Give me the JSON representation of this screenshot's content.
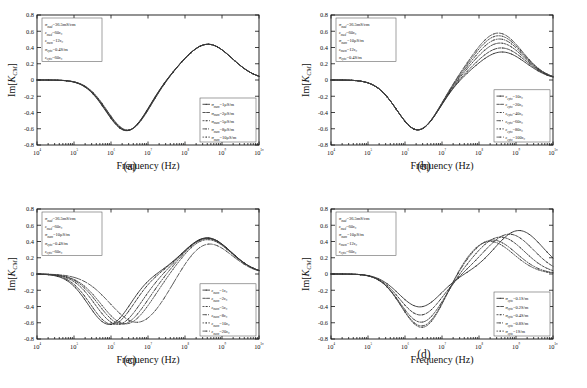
{
  "page_header": "",
  "figure": {
    "panels": [
      {
        "id": "a",
        "caption": "(a)",
        "ylabel": "Im[K_CM]",
        "xlabel": "Frequency (Hz)",
        "param_box": [
          {
            "sym": "σ",
            "sub": "med",
            "val": "=36.5mS/cm"
          },
          {
            "sym": "ε",
            "sub": "med",
            "val": "=60ε₀"
          },
          {
            "sym": "ε",
            "sub": "mem",
            "val": "=12ε₀"
          },
          {
            "sym": "σ",
            "sub": "cyto",
            "val": "=0.4S/m"
          },
          {
            "sym": "ε",
            "sub": "cyto",
            "val": "=60ε₀"
          }
        ],
        "legend_pos": "lower-right",
        "legend": [
          {
            "sym": "σ",
            "sub": "mem",
            "val": "=1μS/m"
          },
          {
            "sym": "σ",
            "sub": "mem",
            "val": "=2μS/m"
          },
          {
            "sym": "σ",
            "sub": "mem",
            "val": "=5μS/m"
          },
          {
            "sym": "σ",
            "sub": "mem",
            "val": "=8μS/m"
          },
          {
            "sym": "σ",
            "sub": "mem",
            "val": "=10μS/m"
          }
        ]
      },
      {
        "id": "b",
        "caption": "(b)",
        "ylabel": "Im[K_CM]",
        "xlabel": "Frequency (Hz)",
        "param_box": [
          {
            "sym": "σ",
            "sub": "med",
            "val": "=36.5mS/cm"
          },
          {
            "sym": "ε",
            "sub": "med",
            "val": "=60ε₀"
          },
          {
            "sym": "σ",
            "sub": "mem",
            "val": "=10μS/m"
          },
          {
            "sym": "ε",
            "sub": "mem",
            "val": "=12ε₀"
          },
          {
            "sym": "σ",
            "sub": "cyto",
            "val": "=0.4S/m"
          }
        ],
        "legend_pos": "lower-right",
        "legend": [
          {
            "sym": "ε",
            "sub": "cyto",
            "val": "=10ε₀"
          },
          {
            "sym": "ε",
            "sub": "cyto",
            "val": "=20ε₀"
          },
          {
            "sym": "ε",
            "sub": "cyto",
            "val": "=40ε₀"
          },
          {
            "sym": "ε",
            "sub": "cyto",
            "val": "=60ε₀"
          },
          {
            "sym": "ε",
            "sub": "cyto",
            "val": "=80ε₀"
          },
          {
            "sym": "ε",
            "sub": "cyto",
            "val": "=100ε₀"
          }
        ]
      },
      {
        "id": "c",
        "caption": "(c)",
        "ylabel": "Im[K_CM]",
        "xlabel": "Frequency (Hz)",
        "param_box": [
          {
            "sym": "σ",
            "sub": "med",
            "val": "=36.5mS/cm"
          },
          {
            "sym": "ε",
            "sub": "med",
            "val": "=60ε₀"
          },
          {
            "sym": "σ",
            "sub": "mem",
            "val": "=10μS/m"
          },
          {
            "sym": "σ",
            "sub": "cyto",
            "val": "=0.4S/m"
          },
          {
            "sym": "ε",
            "sub": "cyto",
            "val": "=60ε₀"
          }
        ],
        "legend_pos": "lower-right",
        "legend": [
          {
            "sym": "ε",
            "sub": "mem",
            "val": "=1ε₀"
          },
          {
            "sym": "ε",
            "sub": "mem",
            "val": "=2ε₀"
          },
          {
            "sym": "ε",
            "sub": "mem",
            "val": "=5ε₀"
          },
          {
            "sym": "ε",
            "sub": "mem",
            "val": "=8ε₀"
          },
          {
            "sym": "ε",
            "sub": "mem",
            "val": "=10ε₀"
          },
          {
            "sym": "ε",
            "sub": "mem",
            "val": "=20ε₀"
          }
        ]
      },
      {
        "id": "d",
        "caption": "(d)",
        "ylabel": "Im[K_CM]",
        "xlabel": "Frequency (Hz)",
        "param_box": [
          {
            "sym": "σ",
            "sub": "med",
            "val": "=36.5mS/cm"
          },
          {
            "sym": "ε",
            "sub": "med",
            "val": "=60ε₀"
          },
          {
            "sym": "σ",
            "sub": "mem",
            "val": "=10μS/m"
          },
          {
            "sym": "ε",
            "sub": "mem",
            "val": "=12ε₀"
          },
          {
            "sym": "ε",
            "sub": "cyto",
            "val": "=60ε₀"
          }
        ],
        "legend_pos": "lower-right",
        "legend": [
          {
            "sym": "σ",
            "sub": "cyto",
            "val": "=0.1S/m"
          },
          {
            "sym": "σ",
            "sub": "cyto",
            "val": "=0.2S/m"
          },
          {
            "sym": "σ",
            "sub": "cyto",
            "val": "=0.4S/m"
          },
          {
            "sym": "σ",
            "sub": "cyto",
            "val": "=0.8S/m"
          },
          {
            "sym": "σ",
            "sub": "cyto",
            "val": "=1S/m"
          }
        ]
      }
    ]
  },
  "chart_data": [
    {
      "type": "line",
      "panel": "a",
      "title": "",
      "xlabel": "Frequency (Hz)",
      "ylabel": "Im[K_CM]",
      "xscale": "log",
      "xlim": [
        10000,
        10000000000
      ],
      "ylim": [
        -0.8,
        0.8
      ],
      "xticks": [
        4,
        5,
        6,
        7,
        8,
        9,
        10
      ],
      "xticklabels": [
        "10⁴",
        "10⁵",
        "10⁶",
        "10⁷",
        "10⁸",
        "10⁹",
        "10¹⁰"
      ],
      "yticks": [
        -0.8,
        -0.6,
        -0.4,
        -0.2,
        0,
        0.2,
        0.4,
        0.6,
        0.8
      ],
      "grid": false,
      "legend_position": "lower right",
      "series": [
        {
          "name": "σmem=1μS/m",
          "dip_decade": 6.42,
          "dip_value": -0.625,
          "peak_decade": 8.62,
          "peak_value": 0.44
        },
        {
          "name": "σmem=2μS/m",
          "dip_decade": 6.43,
          "dip_value": -0.624,
          "peak_decade": 8.62,
          "peak_value": 0.44
        },
        {
          "name": "σmem=5μS/m",
          "dip_decade": 6.44,
          "dip_value": -0.622,
          "peak_decade": 8.62,
          "peak_value": 0.44
        },
        {
          "name": "σmem=8μS/m",
          "dip_decade": 6.45,
          "dip_value": -0.62,
          "peak_decade": 8.62,
          "peak_value": 0.44
        },
        {
          "name": "σmem=10μS/m",
          "dip_decade": 6.46,
          "dip_value": -0.618,
          "peak_decade": 8.62,
          "peak_value": 0.44
        }
      ]
    },
    {
      "type": "line",
      "panel": "b",
      "title": "",
      "xlabel": "Frequency (Hz)",
      "ylabel": "Im[K_CM]",
      "xscale": "log",
      "xlim": [
        10000,
        10000000000
      ],
      "ylim": [
        -0.8,
        0.8
      ],
      "xticks": [
        4,
        5,
        6,
        7,
        8,
        9,
        10
      ],
      "xticklabels": [
        "10⁴",
        "10⁵",
        "10⁶",
        "10⁷",
        "10⁸",
        "10⁹",
        "10¹⁰"
      ],
      "yticks": [
        -0.8,
        -0.6,
        -0.4,
        -0.2,
        0,
        0.2,
        0.4,
        0.6,
        0.8
      ],
      "grid": false,
      "legend_position": "lower right",
      "series": [
        {
          "name": "εcyto=10ε₀",
          "dip_decade": 6.35,
          "dip_value": -0.615,
          "peak_decade": 8.62,
          "peak_value": 0.345
        },
        {
          "name": "εcyto=20ε₀",
          "dip_decade": 6.35,
          "dip_value": -0.615,
          "peak_decade": 8.6,
          "peak_value": 0.395
        },
        {
          "name": "εcyto=40ε₀",
          "dip_decade": 6.35,
          "dip_value": -0.615,
          "peak_decade": 8.57,
          "peak_value": 0.455
        },
        {
          "name": "εcyto=60ε₀",
          "dip_decade": 6.35,
          "dip_value": -0.615,
          "peak_decade": 8.55,
          "peak_value": 0.505
        },
        {
          "name": "εcyto=80ε₀",
          "dip_decade": 6.35,
          "dip_value": -0.615,
          "peak_decade": 8.53,
          "peak_value": 0.545
        },
        {
          "name": "εcyto=100ε₀",
          "dip_decade": 6.35,
          "dip_value": -0.615,
          "peak_decade": 8.52,
          "peak_value": 0.578
        }
      ]
    },
    {
      "type": "line",
      "panel": "c",
      "title": "",
      "xlabel": "Frequency (Hz)",
      "ylabel": "Im[K_CM]",
      "xscale": "log",
      "xlim": [
        10000,
        10000000000
      ],
      "ylim": [
        -0.8,
        0.8
      ],
      "xticks": [
        4,
        5,
        6,
        7,
        8,
        9,
        10
      ],
      "xticklabels": [
        "10⁴",
        "10⁵",
        "10⁶",
        "10⁷",
        "10⁸",
        "10⁹",
        "10¹⁰"
      ],
      "yticks": [
        -0.8,
        -0.6,
        -0.4,
        -0.2,
        0,
        0.2,
        0.4,
        0.6,
        0.8
      ],
      "grid": false,
      "legend_position": "lower right",
      "series": [
        {
          "name": "εmem=1ε₀",
          "dip_decade": 5.95,
          "dip_value": -0.62,
          "peak_decade": 8.6,
          "peak_value": 0.445,
          "dip_width": 0.8
        },
        {
          "name": "εmem=2ε₀",
          "dip_decade": 6.03,
          "dip_value": -0.62,
          "peak_decade": 8.6,
          "peak_value": 0.443,
          "dip_width": 0.82
        },
        {
          "name": "εmem=5ε₀",
          "dip_decade": 6.18,
          "dip_value": -0.62,
          "peak_decade": 8.6,
          "peak_value": 0.44,
          "dip_width": 0.86
        },
        {
          "name": "εmem=8ε₀",
          "dip_decade": 6.3,
          "dip_value": -0.618,
          "peak_decade": 8.6,
          "peak_value": 0.435,
          "dip_width": 0.9
        },
        {
          "name": "εmem=10ε₀",
          "dip_decade": 6.4,
          "dip_value": -0.615,
          "peak_decade": 8.6,
          "peak_value": 0.425,
          "dip_width": 0.94
        },
        {
          "name": "εmem=20ε₀",
          "dip_decade": 6.72,
          "dip_value": -0.6,
          "peak_decade": 8.6,
          "peak_value": 0.39,
          "dip_width": 1.05
        }
      ]
    },
    {
      "type": "line",
      "panel": "d",
      "title": "",
      "xlabel": "Frequency (Hz)",
      "ylabel": "Im[K_CM]",
      "xscale": "log",
      "xlim": [
        10000,
        10000000000
      ],
      "ylim": [
        -0.8,
        0.8
      ],
      "xticks": [
        4,
        5,
        6,
        7,
        8,
        9,
        10
      ],
      "xticklabels": [
        "10⁴",
        "10⁵",
        "10⁶",
        "10⁷",
        "10⁸",
        "10⁹",
        "10¹⁰"
      ],
      "yticks": [
        -0.8,
        -0.6,
        -0.4,
        -0.2,
        0,
        0.2,
        0.4,
        0.6,
        0.8
      ],
      "grid": false,
      "legend_position": "lower right",
      "series": [
        {
          "name": "σcyto=0.1S/m",
          "dip_decade": 6.4,
          "dip_value": -0.405,
          "peak_decade": 9.08,
          "peak_value": 0.535
        },
        {
          "name": "σcyto=0.2S/m",
          "dip_decade": 6.42,
          "dip_value": -0.505,
          "peak_decade": 8.82,
          "peak_value": 0.49
        },
        {
          "name": "σcyto=0.4S/m",
          "dip_decade": 6.44,
          "dip_value": -0.595,
          "peak_decade": 8.58,
          "peak_value": 0.455
        },
        {
          "name": "σcyto=0.8S/m",
          "dip_decade": 6.46,
          "dip_value": -0.645,
          "peak_decade": 8.36,
          "peak_value": 0.42
        },
        {
          "name": "σcyto=1S/m",
          "dip_decade": 6.47,
          "dip_value": -0.665,
          "peak_decade": 8.28,
          "peak_value": 0.405
        }
      ]
    }
  ]
}
